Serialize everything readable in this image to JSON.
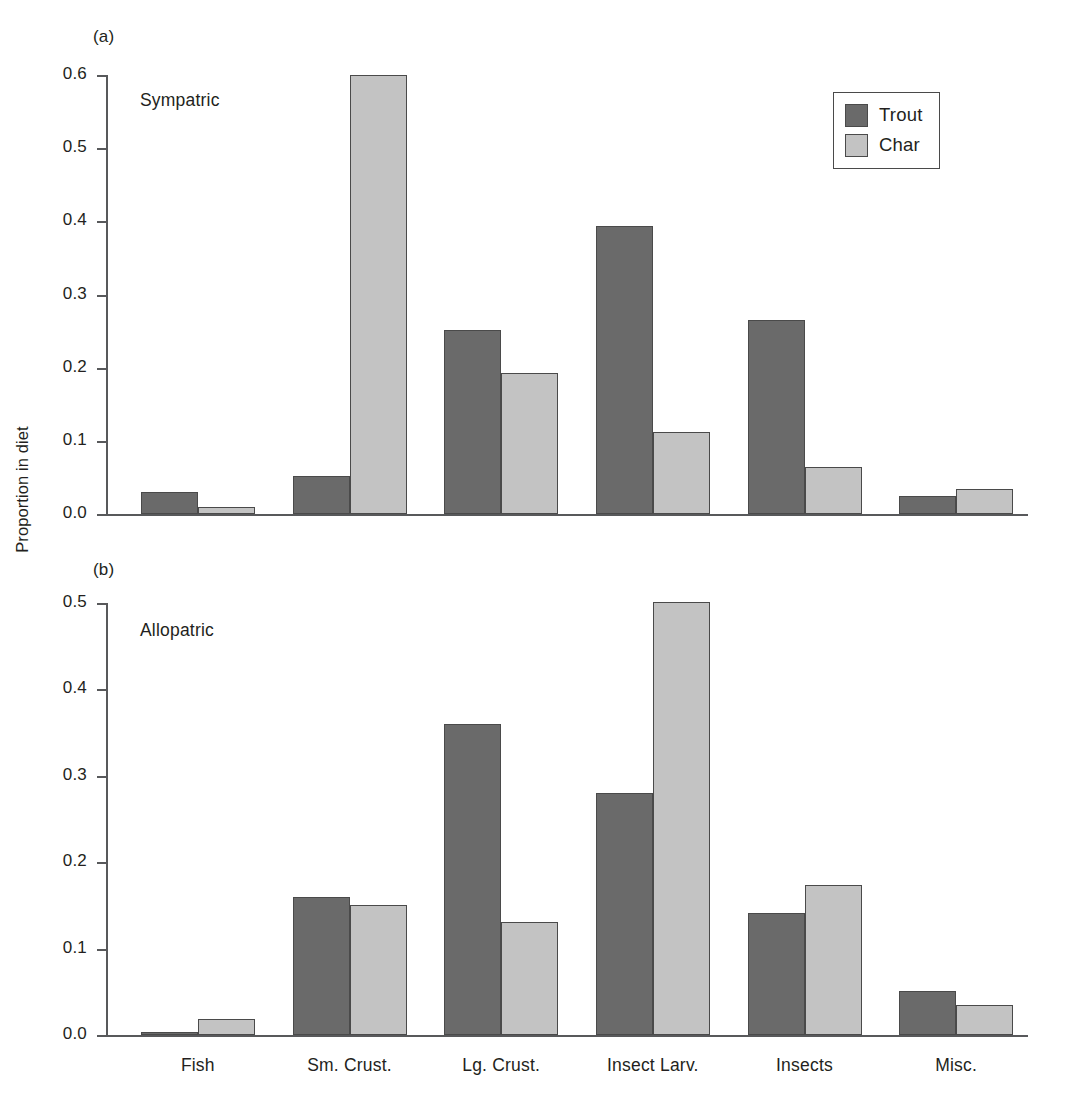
{
  "figure": {
    "ylabel": "Proportion in diet"
  },
  "legend": {
    "position": "top-right",
    "entries": [
      {
        "label": "Trout",
        "color": "#6a6a6a",
        "key": "trout"
      },
      {
        "label": "Char",
        "color": "#c3c3c3",
        "key": "char"
      }
    ]
  },
  "panels": [
    {
      "tag": "(a)",
      "note": "Sympatric",
      "yticks": [
        "0.0",
        "0.1",
        "0.2",
        "0.3",
        "0.4",
        "0.5",
        "0.6"
      ]
    },
    {
      "tag": "(b)",
      "note": "Allopatric",
      "yticks": [
        "0.0",
        "0.1",
        "0.2",
        "0.3",
        "0.4",
        "0.5"
      ]
    }
  ],
  "chart_data": [
    {
      "type": "bar",
      "title": "(a) Sympatric",
      "panel": "a",
      "categories": [
        "Fish",
        "Sm. Crust.",
        "Lg. Crust.",
        "Insect Larv.",
        "Insects",
        "Misc."
      ],
      "series": [
        {
          "name": "Trout",
          "color": "#6a6a6a",
          "values": [
            0.03,
            0.052,
            0.251,
            0.394,
            0.265,
            0.024
          ]
        },
        {
          "name": "Char",
          "color": "#c3c3c3",
          "values": [
            0.01,
            0.6,
            0.193,
            0.112,
            0.064,
            0.034
          ]
        }
      ],
      "xlabel": "",
      "ylabel": "Proportion in diet",
      "ylim": [
        0.0,
        0.6
      ],
      "ytick_step": 0.1,
      "grid": false,
      "legend": "top-right"
    },
    {
      "type": "bar",
      "title": "(b) Allopatric",
      "panel": "b",
      "categories": [
        "Fish",
        "Sm. Crust.",
        "Lg. Crust.",
        "Insect Larv.",
        "Insects",
        "Misc."
      ],
      "series": [
        {
          "name": "Trout",
          "color": "#6a6a6a",
          "values": [
            0.003,
            0.16,
            0.36,
            0.28,
            0.141,
            0.051
          ]
        },
        {
          "name": "Char",
          "color": "#c3c3c3",
          "values": [
            0.019,
            0.151,
            0.131,
            0.501,
            0.174,
            0.035
          ]
        }
      ],
      "xlabel": "",
      "ylabel": "Proportion in diet",
      "ylim": [
        0.0,
        0.5
      ],
      "ytick_step": 0.1,
      "grid": false,
      "legend": "none"
    }
  ]
}
